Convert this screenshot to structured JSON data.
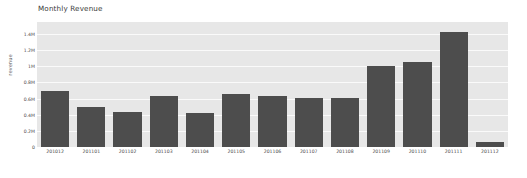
{
  "chart_data": {
    "type": "bar",
    "title": "Monthly Revenue",
    "xlabel": "",
    "ylabel": "revenue",
    "categories": [
      "201012",
      "201101",
      "201102",
      "201103",
      "201104",
      "201105",
      "201106",
      "201107",
      "201108",
      "201109",
      "201110",
      "201111",
      "201112"
    ],
    "values": [
      690000,
      490000,
      430000,
      630000,
      420000,
      660000,
      630000,
      610000,
      610000,
      1000000,
      1050000,
      1430000,
      60000
    ],
    "ylim": [
      0,
      1550000
    ],
    "y_ticks": [
      0,
      200000,
      400000,
      600000,
      800000,
      1000000,
      1200000,
      1400000
    ],
    "y_tick_labels": [
      "0",
      "0.2M",
      "0.4M",
      "0.6M",
      "0.8M",
      "1M",
      "1.2M",
      "1.4M"
    ],
    "grid": true,
    "legend": null,
    "bar_color": "#4d4d4d",
    "plot_background": "#e7e7e7",
    "gridline_color": "#fafafa",
    "figure_background": "#ffffff"
  }
}
